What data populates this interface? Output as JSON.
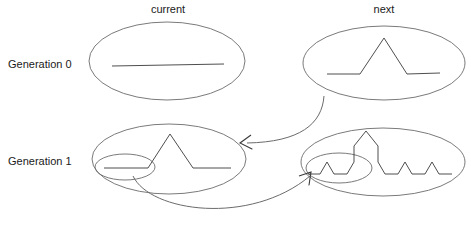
{
  "diagram": {
    "columns": [
      {
        "key": "current",
        "label": "current"
      },
      {
        "key": "next",
        "label": "next"
      }
    ],
    "rows": [
      {
        "key": "generation0",
        "label": "Generation 0"
      },
      {
        "key": "generation1",
        "label": "Generation 1"
      }
    ],
    "style": {
      "background": "#ffffff",
      "ink_light": "#6b6b6b",
      "ink_dark": "#3a3a3a",
      "text_color": "#1a1a1a"
    },
    "cells": [
      {
        "key": "gen0-current",
        "row": "generation0",
        "column": "current",
        "shape_name": "straight-line-initiator",
        "description": "single straight horizontal segment",
        "ellipse": {
          "cx": 167,
          "cy": 61,
          "rx": 78,
          "ry": 39
        },
        "inner_ellipse": null,
        "polyline": [
          [
            112,
            66
          ],
          [
            224,
            64
          ]
        ]
      },
      {
        "key": "gen0-next",
        "row": "generation0",
        "column": "next",
        "shape_name": "koch-generator",
        "description": "line with a single triangular bump in the middle",
        "ellipse": {
          "cx": 384,
          "cy": 63,
          "rx": 81,
          "ry": 37
        },
        "inner_ellipse": null,
        "polyline": [
          [
            327,
            74
          ],
          [
            360,
            74
          ],
          [
            384,
            38
          ],
          [
            407,
            74
          ],
          [
            440,
            73
          ]
        ]
      },
      {
        "key": "gen1-current",
        "row": "generation1",
        "column": "current",
        "shape_name": "koch-generator",
        "description": "line with a single triangular bump; leftmost segment circled for replacement",
        "ellipse": {
          "cx": 169,
          "cy": 159,
          "rx": 77,
          "ry": 35
        },
        "inner_ellipse": {
          "cx": 125,
          "cy": 167,
          "rx": 30,
          "ry": 13
        },
        "polyline": [
          [
            104,
            168
          ],
          [
            148,
            168
          ],
          [
            170,
            134
          ],
          [
            193,
            168
          ],
          [
            231,
            168
          ]
        ]
      },
      {
        "key": "gen1-next",
        "row": "generation1",
        "column": "next",
        "shape_name": "koch-curve-iteration-2",
        "description": "four sub-generators, each a line with a triangular bump; first sub-generator circled",
        "ellipse": {
          "cx": 383,
          "cy": 162,
          "rx": 82,
          "ry": 34
        },
        "inner_ellipse": {
          "cx": 339,
          "cy": 168,
          "rx": 33,
          "ry": 15
        },
        "polyline": [
          [
            308,
            174
          ],
          [
            320,
            174
          ],
          [
            327,
            162
          ],
          [
            334,
            174
          ],
          [
            347,
            174
          ],
          [
            354,
            162
          ],
          [
            354,
            146
          ],
          [
            366,
            131
          ],
          [
            378,
            146
          ],
          [
            378,
            162
          ],
          [
            385,
            174
          ],
          [
            398,
            174
          ],
          [
            405,
            162
          ],
          [
            412,
            174
          ],
          [
            425,
            174
          ],
          [
            432,
            162
          ],
          [
            439,
            174
          ],
          [
            452,
            174
          ]
        ]
      }
    ],
    "arrows": [
      {
        "key": "generator-to-current",
        "from": "gen0-next",
        "to": "gen1-current",
        "semantic": "next generation becomes current",
        "path": "M 324,96 C 322,124 300,142 247,143",
        "head": [
          [
            240,
            143
          ],
          [
            251,
            135
          ],
          [
            240,
            143
          ],
          [
            252,
            149
          ]
        ]
      },
      {
        "key": "segment-to-subgenerator",
        "from": "gen1-current-inner",
        "to": "gen1-next-inner",
        "semantic": "each segment is replaced by the generator",
        "path": "M 133,176 C 150,212 250,226 310,176",
        "head": [
          [
            311,
            172
          ],
          [
            299,
            176
          ],
          [
            311,
            172
          ],
          [
            309,
            185
          ]
        ]
      }
    ]
  }
}
